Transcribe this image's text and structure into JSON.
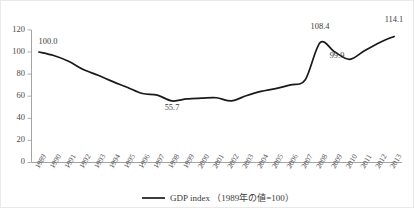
{
  "chart_data": {
    "type": "line",
    "title": "",
    "subtitle": "",
    "xlabel": "",
    "ylabel": "",
    "grid": false,
    "legend_position": "bottom-center",
    "ylim": [
      0,
      120
    ],
    "ytick_labels": [
      "0",
      "20",
      "40",
      "60",
      "80",
      "100",
      "120"
    ],
    "ytick_values": [
      0,
      20,
      40,
      60,
      80,
      100,
      120
    ],
    "categories": [
      "1989",
      "1990",
      "1991",
      "1992",
      "1993",
      "1994",
      "1995",
      "1996",
      "1997",
      "1998",
      "1999",
      "2000",
      "2001",
      "2002",
      "2003",
      "2004",
      "2005",
      "2006",
      "2007",
      "2008",
      "2009",
      "2010",
      "2011",
      "2012",
      "2013"
    ],
    "series": [
      {
        "name": "GDP index （1989年の値=100）",
        "color": "#1a1a1a",
        "values": [
          100.0,
          96.8,
          91.6,
          84.2,
          78.9,
          73.2,
          67.9,
          62.4,
          61.0,
          58.9,
          57.6,
          58.2,
          58.6,
          55.7,
          60.4,
          64.3,
          66.9,
          70.3,
          74.9,
          80.2,
          86.6,
          93.4,
          101.1,
          108.4,
          99.9
        ]
      }
    ],
    "annotations": [
      {
        "category": "1989",
        "value": 100.0,
        "label": "100.0",
        "position": "above"
      },
      {
        "category": "1998",
        "value": 55.7,
        "label": "55.7",
        "position": "below"
      },
      {
        "category": "2008",
        "value": 108.4,
        "label": "108.4",
        "position": "above"
      },
      {
        "category": "2009",
        "value": 99.9,
        "label": "99.9",
        "position": "below"
      },
      {
        "category": "2013",
        "value": 114.1,
        "label": "114.1",
        "position": "above"
      }
    ]
  },
  "legend": {
    "entries": [
      {
        "label": "GDP index （1989年の値=100）",
        "marker": "line-swatch",
        "color": "#1a1a1a"
      }
    ]
  },
  "labels": {
    "y_0": "0",
    "y_20": "20",
    "y_40": "40",
    "y_60": "60",
    "y_80": "80",
    "y_100": "100",
    "y_120": "120",
    "x_1989": "1989",
    "x_1990": "1990",
    "x_1991": "1991",
    "x_1992": "1992",
    "x_1993": "1993",
    "x_1994": "1994",
    "x_1995": "1995",
    "x_1996": "1996",
    "x_1997": "1997",
    "x_1998": "1998",
    "x_1999": "1999",
    "x_2000": "2000",
    "x_2001": "2001",
    "x_2002": "2002",
    "x_2003": "2003",
    "x_2004": "2004",
    "x_2005": "2005",
    "x_2006": "2006",
    "x_2007": "2007",
    "x_2008": "2008",
    "x_2009": "2009",
    "x_2010": "2010",
    "x_2011": "2011",
    "x_2012": "2012",
    "x_2013": "2013",
    "ann_100": "100.0",
    "ann_55_7": "55.7",
    "ann_108_4": "108.4",
    "ann_99_9": "99.9",
    "ann_114_1": "114.1"
  }
}
